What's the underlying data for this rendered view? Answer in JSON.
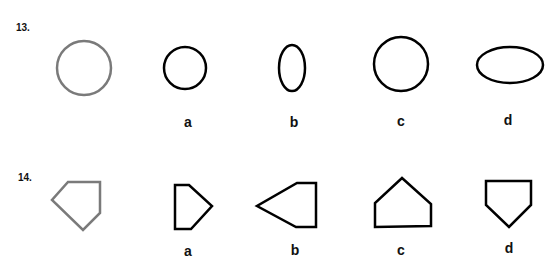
{
  "questions": [
    {
      "number": "13.",
      "target": {
        "shape": "circle",
        "color": "#7a7a7a"
      },
      "options": [
        {
          "label": "a",
          "shape": "circle"
        },
        {
          "label": "b",
          "shape": "tall-ellipse"
        },
        {
          "label": "c",
          "shape": "circle"
        },
        {
          "label": "d",
          "shape": "wide-ellipse"
        }
      ]
    },
    {
      "number": "14.",
      "target": {
        "shape": "pentagon",
        "color": "#7a7a7a"
      },
      "options": [
        {
          "label": "a",
          "shape": "pentagon"
        },
        {
          "label": "b",
          "shape": "pentagon"
        },
        {
          "label": "c",
          "shape": "pentagon"
        },
        {
          "label": "d",
          "shape": "pentagon"
        }
      ]
    }
  ],
  "colors": {
    "target_stroke": "#7a7a7a",
    "option_stroke": "#000000"
  }
}
